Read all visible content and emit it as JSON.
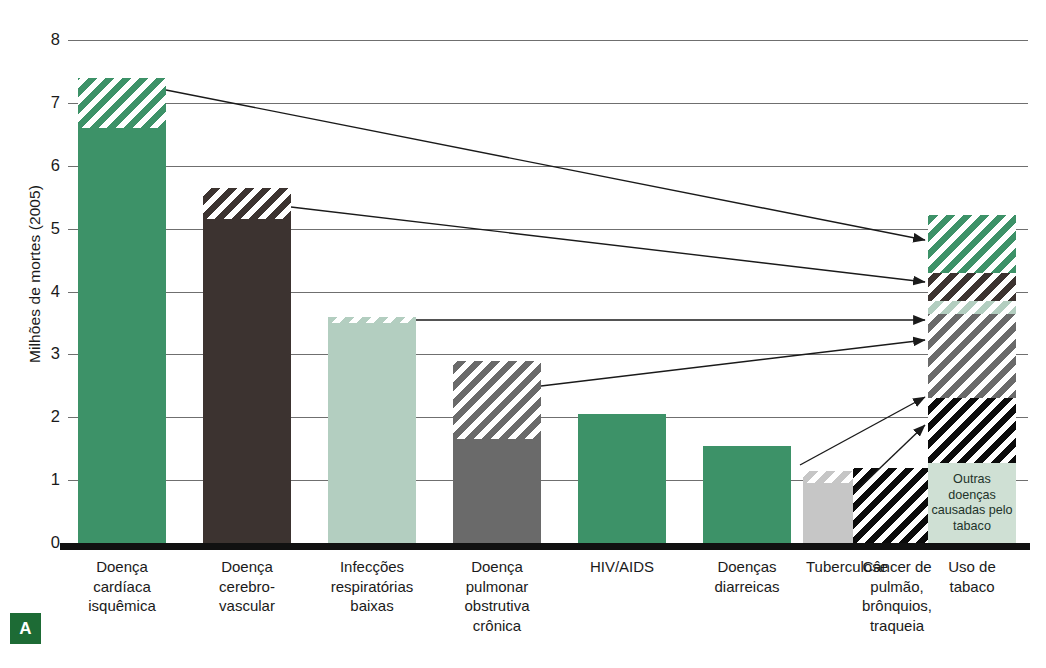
{
  "chart_data": {
    "type": "bar",
    "title": "",
    "xlabel": "",
    "ylabel": "Milhões de mortes (2005)",
    "ylim": [
      0,
      8
    ],
    "ytick_labels": [
      "0",
      "1",
      "2",
      "3",
      "4",
      "5",
      "6",
      "7",
      "8"
    ],
    "ytick_values": [
      0,
      1,
      2,
      3,
      4,
      5,
      6,
      7,
      8
    ],
    "grid": true,
    "legend": "none",
    "categories": [
      "Doença cardíaca isquêmica",
      "Doença cerebro-vascular",
      "Infecções respiratórias baixas",
      "Doença pulmonar obstrutiva crônica",
      "HIV/AIDS",
      "Doenças diarreicas",
      "Tuberculose",
      "Câncer de pulmão, brônquios, traqueia",
      "Uso de tabaco"
    ],
    "values": [
      7.4,
      5.65,
      3.6,
      2.9,
      2.05,
      1.55,
      1.15,
      1.2,
      5.22
    ],
    "series": [
      {
        "name": "Mortes não atribuíveis ao tabaco",
        "values": [
          6.6,
          5.15,
          3.5,
          1.65,
          2.05,
          1.55,
          0.95,
          0.0,
          0.0
        ]
      },
      {
        "name": "Mortes atribuíveis ao tabaco",
        "values": [
          0.8,
          0.5,
          0.1,
          1.25,
          0.0,
          0.0,
          0.2,
          1.2,
          5.22
        ]
      }
    ],
    "annotation": "Outras doenças causadas pelo tabaco",
    "panel_letter": "A"
  },
  "axis": {
    "y_title": "Milhões de mortes (2005)",
    "ticks": [
      "8",
      "7",
      "6",
      "5",
      "4",
      "3",
      "2",
      "1",
      "0"
    ]
  },
  "bars": [
    {
      "id": "doenca-cardiaca-isquemica",
      "label_lines": [
        "Doença",
        "cardíaca",
        "isquêmica"
      ],
      "total": 7.4,
      "left": 78,
      "width": 88,
      "segments": [
        {
          "name": "base",
          "fill": "solid-green",
          "from": 0.0,
          "to": 6.6
        },
        {
          "name": "tobacco",
          "fill": "hatch-green",
          "from": 6.6,
          "to": 7.4
        }
      ]
    },
    {
      "id": "doenca-cerebrovascular",
      "label_lines": [
        "Doença",
        "cerebro-",
        "vascular"
      ],
      "total": 5.65,
      "left": 203,
      "width": 88,
      "segments": [
        {
          "name": "base",
          "fill": "solid-darkbrown",
          "from": 0.0,
          "to": 5.15
        },
        {
          "name": "tobacco",
          "fill": "hatch-darkbrown",
          "from": 5.15,
          "to": 5.65
        }
      ]
    },
    {
      "id": "infeccoes-respiratorias-baixas",
      "label_lines": [
        "Infecções",
        "respiratórias",
        "baixas"
      ],
      "total": 3.6,
      "left": 328,
      "width": 88,
      "segments": [
        {
          "name": "base",
          "fill": "solid-ltgreen",
          "from": 0.0,
          "to": 3.5
        },
        {
          "name": "tobacco",
          "fill": "hatch-ltgreen",
          "from": 3.5,
          "to": 3.6
        }
      ]
    },
    {
      "id": "doenca-pulmonar-obstrutiva-cronica",
      "label_lines": [
        "Doença",
        "pulmonar",
        "obstrutiva",
        "crônica"
      ],
      "total": 2.9,
      "left": 453,
      "width": 88,
      "segments": [
        {
          "name": "base",
          "fill": "solid-dkgray",
          "from": 0.0,
          "to": 1.65
        },
        {
          "name": "tobacco",
          "fill": "hatch-dkgray",
          "from": 1.65,
          "to": 2.9
        }
      ]
    },
    {
      "id": "hiv-aids",
      "label_lines": [
        "HIV/AIDS"
      ],
      "total": 2.05,
      "left": 578,
      "width": 88,
      "segments": [
        {
          "name": "base",
          "fill": "solid-green",
          "from": 0.0,
          "to": 2.05
        }
      ]
    },
    {
      "id": "doencas-diarreicas",
      "label_lines": [
        "Doenças",
        "diarreicas"
      ],
      "total": 1.55,
      "left": 703,
      "width": 88,
      "segments": [
        {
          "name": "base",
          "fill": "solid-green",
          "from": 0.0,
          "to": 1.55
        }
      ]
    },
    {
      "id": "tuberculose",
      "label_lines": [
        "Tuberculose"
      ],
      "total": 1.15,
      "left": 803,
      "width": 88,
      "segments": [
        {
          "name": "base",
          "fill": "solid-ltgray",
          "from": 0.0,
          "to": 0.95
        },
        {
          "name": "tobacco",
          "fill": "hatch-ltgray",
          "from": 0.95,
          "to": 1.15
        }
      ]
    },
    {
      "id": "cancer-de-pulmao",
      "label_lines": [
        "Câncer de",
        "pulmão,",
        "brônquios,",
        "traqueia"
      ],
      "total": 1.2,
      "left": 853,
      "width": 88,
      "segments": [
        {
          "name": "tobacco",
          "fill": "hatch-black",
          "from": 0.0,
          "to": 1.2
        }
      ]
    },
    {
      "id": "uso-de-tabaco",
      "label_lines": [
        "Uso de",
        "tabaco"
      ],
      "total": 5.22,
      "left": 928,
      "width": 88,
      "segments": [
        {
          "name": "outras-doencas",
          "fill": "solid-label",
          "from": 0.0,
          "to": 1.27,
          "text": "Outras doenças causadas pelo tabaco"
        },
        {
          "name": "cancer-pulmao",
          "fill": "hatch-black",
          "from": 1.27,
          "to": 2.3
        },
        {
          "name": "dpoc",
          "fill": "hatch-dkgray",
          "from": 2.3,
          "to": 3.65
        },
        {
          "name": "infeccoes",
          "fill": "hatch-ltgreen",
          "from": 3.65,
          "to": 3.85
        },
        {
          "name": "cerebrovascular",
          "fill": "hatch-darkbrown",
          "from": 3.85,
          "to": 4.3
        },
        {
          "name": "cardiaca",
          "fill": "hatch-green",
          "from": 4.3,
          "to": 5.22
        }
      ]
    }
  ],
  "connectors": [
    {
      "id": "cardiaca-para-tabaco",
      "x1": 166,
      "y1": 90,
      "x2": 925,
      "y2": 240
    },
    {
      "id": "cerebrovascular-para-tabaco",
      "x1": 291,
      "y1": 207,
      "x2": 925,
      "y2": 282
    },
    {
      "id": "infeccoes-para-tabaco",
      "x1": 416,
      "y1": 320,
      "x2": 925,
      "y2": 320
    },
    {
      "id": "dpoc-para-tabaco",
      "x1": 541,
      "y1": 386,
      "x2": 925,
      "y2": 340
    },
    {
      "id": "tuberculose-para-tabaco",
      "x1": 800,
      "y1": 465,
      "x2": 925,
      "y2": 397
    },
    {
      "id": "cancer-para-tabaco",
      "x1": 855,
      "y1": 492,
      "x2": 925,
      "y2": 425
    }
  ],
  "panel": {
    "letter": "A"
  },
  "colors": {
    "green": "#3d9268",
    "dark_brown": "#3c3330",
    "light_green": "#b3cec0",
    "dark_gray": "#6a6a6a",
    "light_gray": "#c6c6c6",
    "black": "#0b0b0b",
    "label_box": "#cfe0d4",
    "panel_badge": "#1d6b35",
    "gridline": "#6f6f6f"
  }
}
